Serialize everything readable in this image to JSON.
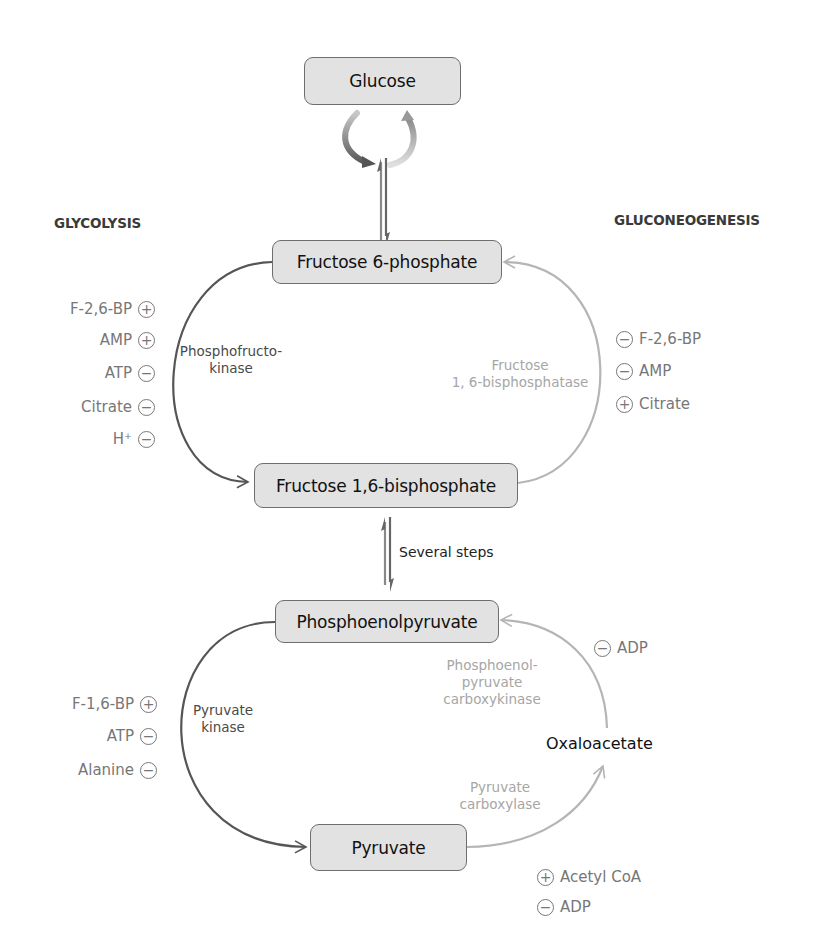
{
  "headers": {
    "left": "GLYCOLYSIS",
    "right": "GLUCONEOGENESIS"
  },
  "metabolites": {
    "glucose": "Glucose",
    "f6p": "Fructose 6-phosphate",
    "f16bp": "Fructose 1,6-bisphosphate",
    "pep": "Phosphoenolpyruvate",
    "oxaloacetate": "Oxaloacetate",
    "pyruvate": "Pyruvate"
  },
  "steps_label": "Several steps",
  "enzymes": {
    "pfk": [
      "Phosphofructo-",
      "kinase"
    ],
    "fbpase": [
      "Fructose",
      "1, 6-bisphosphatase"
    ],
    "pk": [
      "Pyruvate",
      "kinase"
    ],
    "pepck": [
      "Phosphoenol-",
      "pyruvate",
      "carboxykinase"
    ],
    "pc": [
      "Pyruvate",
      "carboxylase"
    ]
  },
  "regulators": {
    "pfk": [
      {
        "name": "F-2,6-BP",
        "sign": "+"
      },
      {
        "name": "AMP",
        "sign": "+"
      },
      {
        "name": "ATP",
        "sign": "−"
      },
      {
        "name": "Citrate",
        "sign": "−"
      },
      {
        "name": "H⁺",
        "sign": "−"
      }
    ],
    "fbpase": [
      {
        "name": "F-2,6-BP",
        "sign": "−"
      },
      {
        "name": "AMP",
        "sign": "−"
      },
      {
        "name": "Citrate",
        "sign": "+"
      }
    ],
    "pk": [
      {
        "name": "F-1,6-BP",
        "sign": "+"
      },
      {
        "name": "ATP",
        "sign": "−"
      },
      {
        "name": "Alanine",
        "sign": "−"
      }
    ],
    "pepck": [
      {
        "name": "ADP",
        "sign": "−"
      }
    ],
    "pc": [
      {
        "name": "Acetyl CoA",
        "sign": "+"
      },
      {
        "name": "ADP",
        "sign": "−"
      }
    ]
  },
  "colors": {
    "glycolysis_arrow": "#555555",
    "gluconeogenesis_arrow": "#b5b5b5",
    "box_fill": "#e2e2e2",
    "regulator_text": "#777777"
  }
}
